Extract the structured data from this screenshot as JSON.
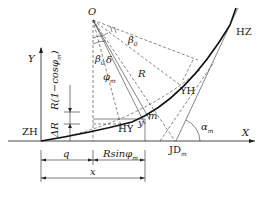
{
  "diagram": {
    "type": "transition curve geometry (spiral + circular curve)",
    "axes": {
      "x_label": "X",
      "y_label": "Y"
    },
    "points": {
      "center": "O",
      "start": "ZH",
      "spiral_circle": "HY",
      "circle_spiral": "YH",
      "end": "HZ",
      "intersection": "JD",
      "intersection_sub": "m",
      "point_m": "m"
    },
    "angles": {
      "beta0": "β",
      "beta0_sub": "0",
      "beta0_lower": "β",
      "beta0_lower_sub": "0",
      "delta": "δ",
      "phi_m": "φ",
      "phi_m_sub": "m",
      "alpha_m": "α",
      "alpha_m_sub": "m"
    },
    "lengths": {
      "radius": "R",
      "y": "y",
      "shift": "ΔR",
      "vertical": "R(1−cosφ",
      "vertical_sub": "m",
      "vertical_close": ")",
      "q": "q",
      "rsin": "Rsinφ",
      "rsin_sub": "m",
      "x": "x"
    }
  }
}
